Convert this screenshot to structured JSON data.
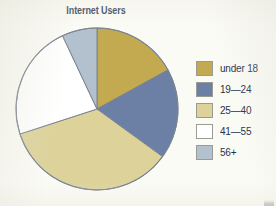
{
  "chart_data": {
    "type": "pie",
    "title": "Internet Users",
    "categories": [
      "under 18",
      "19—24",
      "25—40",
      "41—55",
      "56+"
    ],
    "values": [
      17,
      18,
      35,
      23,
      7
    ],
    "units": "percent",
    "start_angle_deg": 0,
    "direction": "clockwise",
    "legend_position": "right",
    "grid": false,
    "xlabel": "",
    "ylabel": "",
    "slice_colors": [
      "#c3aa51",
      "#6b80a4",
      "#dcd29a",
      "#ffffff",
      "#b3c0ce"
    ],
    "outline_color": "#7b8490",
    "series": [
      {
        "name": "Internet Users",
        "points": [
          {
            "label": "under 18",
            "value": 17,
            "color": "#c3aa51"
          },
          {
            "label": "19—24",
            "value": 18,
            "color": "#6b80a4"
          },
          {
            "label": "25—40",
            "value": 35,
            "color": "#dcd29a"
          },
          {
            "label": "41—55",
            "value": 23,
            "color": "#ffffff"
          },
          {
            "label": "56+",
            "value": 7,
            "color": "#b3c0ce"
          }
        ]
      }
    ]
  },
  "title": {
    "text": "Internet Users",
    "color": "#2d3b56"
  },
  "legend": {
    "items": [
      {
        "label": "under 18",
        "color": "#c3aa51"
      },
      {
        "label": "19—24",
        "color": "#6b80a4"
      },
      {
        "label": "25—40",
        "color": "#dcd29a"
      },
      {
        "label": "41—55",
        "color": "#ffffff"
      },
      {
        "label": "56+",
        "color": "#b3c0ce"
      }
    ]
  },
  "colors": {
    "background": "#fbfbf6",
    "title": "#2d3b56",
    "label": "#26324b",
    "slice_outline": "#7b8490",
    "swatch_outline": "#9b9b93"
  }
}
